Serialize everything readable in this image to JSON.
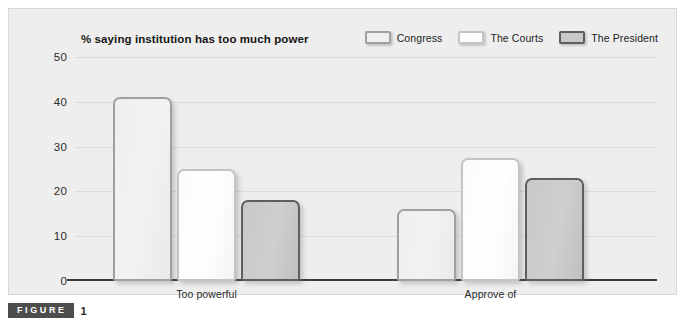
{
  "figure": {
    "badge_label": "FIGURE",
    "number": "1"
  },
  "chart_data": {
    "type": "bar",
    "title": "% saying institution has too much power",
    "xlabel": "",
    "ylabel": "",
    "ylim": [
      0,
      50
    ],
    "yticks": [
      0,
      10,
      20,
      30,
      40,
      50
    ],
    "ytick_labels": [
      "0",
      "10",
      "20",
      "30",
      "40",
      "50"
    ],
    "grid": true,
    "legend_position": "top-right",
    "categories": [
      "Too powerful",
      "Approve of"
    ],
    "series": [
      {
        "name": "Congress",
        "values": [
          41,
          16
        ],
        "fill": "#efefef",
        "border": "#a0a0a0"
      },
      {
        "name": "The Courts",
        "values": [
          25,
          27.5
        ],
        "fill": "#fdfdfd",
        "border": "#c4c4c4"
      },
      {
        "name": "The President",
        "values": [
          18,
          23
        ],
        "fill": "#c8c8c8",
        "border": "#5e5e5e"
      }
    ]
  }
}
